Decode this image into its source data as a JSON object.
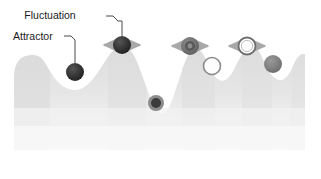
{
  "figure": {
    "title": "",
    "background_color": "#ffffff",
    "width": 321,
    "height": 179
  },
  "labels": [
    {
      "id": "fluctuation",
      "text": "Fluctuation",
      "x": 50,
      "y": 19,
      "points_to": "fluctuation-particle"
    },
    {
      "id": "attractor",
      "text": "Attractor",
      "x": 13,
      "y": 40,
      "points_to": "attractor-particle"
    }
  ],
  "landscape": {
    "name": "energy-landscape",
    "fill_color": "#e2e2e2",
    "shadow_color": "#f0f0f0",
    "edge_color": "#d6d6d6",
    "baseline_y": 150,
    "left_x": 14,
    "right_x": 305,
    "peaks": [
      {
        "x": 40,
        "y": 56
      },
      {
        "x": 122,
        "y": 48
      },
      {
        "x": 190,
        "y": 48
      },
      {
        "x": 248,
        "y": 50
      },
      {
        "x": 296,
        "y": 52
      }
    ],
    "valleys": [
      {
        "x": 75,
        "y": 78
      },
      {
        "x": 157,
        "y": 104
      },
      {
        "x": 218,
        "y": 70
      },
      {
        "x": 274,
        "y": 66
      }
    ]
  },
  "particles": [
    {
      "id": "fluctuation-particle",
      "name": "dark-particle-on-peak",
      "cx": 122,
      "cy": 45,
      "r": 9,
      "style": "filled-dark",
      "color": "#2b2b2b",
      "has_arrows": true,
      "position": "peak"
    },
    {
      "id": "attractor-particle",
      "name": "dark-particle-in-valley",
      "cx": 75,
      "cy": 72,
      "r": 9,
      "style": "filled-dark",
      "color": "#3a3a3a",
      "has_arrows": false,
      "position": "valley"
    },
    {
      "id": "deep-valley-particle",
      "name": "ringed-particle-in-deep-valley",
      "cx": 156,
      "cy": 103,
      "r": 8,
      "style": "ringed-dark",
      "color": "#4a4a4a",
      "ring_color": "#8f8f8f",
      "has_arrows": false,
      "position": "valley"
    },
    {
      "id": "gray-peak-particle",
      "name": "gray-ringed-particle-on-peak",
      "cx": 190,
      "cy": 46,
      "r": 9,
      "style": "ringed-gray",
      "color": "#6e6e6e",
      "ring_color": "#9b9b9b",
      "has_arrows": true,
      "position": "peak"
    },
    {
      "id": "open-valley-particle",
      "name": "open-circle-in-valley",
      "cx": 212,
      "cy": 66,
      "r": 9,
      "style": "open",
      "color": "#ffffff",
      "ring_color": "#8a8a8a",
      "has_arrows": false,
      "position": "valley"
    },
    {
      "id": "open-peak-particle",
      "name": "open-circle-on-peak",
      "cx": 247,
      "cy": 46,
      "r": 9,
      "style": "open",
      "color": "#ffffff",
      "ring_color": "#7d7d7d",
      "has_arrows": true,
      "position": "peak"
    },
    {
      "id": "gray-valley-particle",
      "name": "gray-particle-in-valley",
      "cx": 273,
      "cy": 64,
      "r": 9,
      "style": "filled-gray",
      "color": "#8c8c8c",
      "has_arrows": false,
      "position": "valley"
    }
  ],
  "arrows": {
    "name": "fluctuation-arrows",
    "color": "#a8a8a8",
    "description": "double-headed horizontal arrows flanking peak particles"
  },
  "leader_lines": {
    "color": "#4a4a4a",
    "width": 1
  }
}
